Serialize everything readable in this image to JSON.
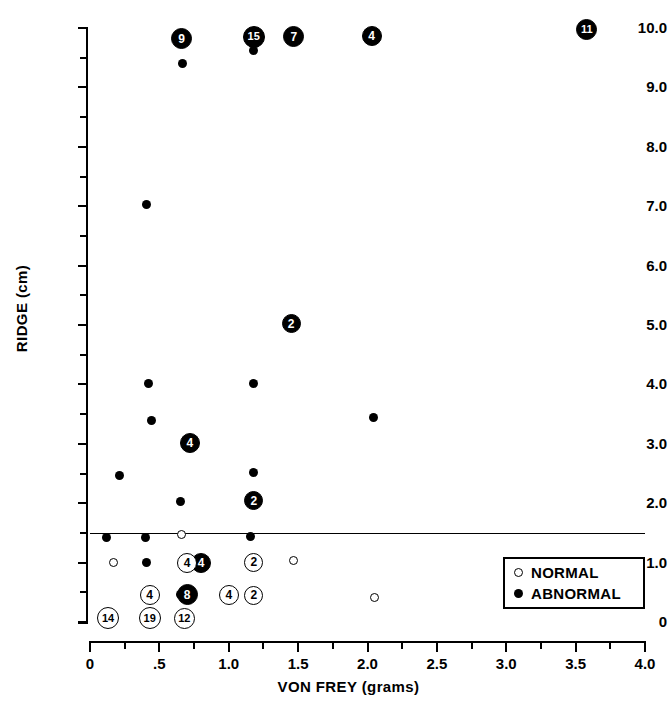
{
  "chart_data": {
    "type": "scatter",
    "title": "",
    "xlabel": "VON FREY (grams)",
    "ylabel": "RIDGE (cm)",
    "xlim": [
      0,
      4.0
    ],
    "ylim": [
      0,
      10.0
    ],
    "grid": false,
    "x_ticks": [
      {
        "value": 0,
        "label": "0"
      },
      {
        "value": 0.5,
        "label": ".5"
      },
      {
        "value": 1.0,
        "label": "1.0"
      },
      {
        "value": 1.5,
        "label": "1.5"
      },
      {
        "value": 2.0,
        "label": "2.0"
      },
      {
        "value": 2.5,
        "label": "2.5"
      },
      {
        "value": 3.0,
        "label": "3.0"
      },
      {
        "value": 3.5,
        "label": "3.5"
      },
      {
        "value": 4.0,
        "label": "4.0"
      }
    ],
    "x_minor_ticks": [
      0.25,
      0.75,
      1.25,
      1.75,
      2.25,
      2.75,
      3.25,
      3.75
    ],
    "y_ticks": [
      {
        "value": 0,
        "label": "0"
      },
      {
        "value": 1.0,
        "label": "1.0"
      },
      {
        "value": 2.0,
        "label": "2.0"
      },
      {
        "value": 3.0,
        "label": "3.0"
      },
      {
        "value": 4.0,
        "label": "4.0"
      },
      {
        "value": 5.0,
        "label": "5.0"
      },
      {
        "value": 6.0,
        "label": "6.0"
      },
      {
        "value": 7.0,
        "label": "7.0"
      },
      {
        "value": 8.0,
        "label": "8.0"
      },
      {
        "value": 9.0,
        "label": "9.0"
      },
      {
        "value": 10.0,
        "label": "10.0"
      }
    ],
    "y_minor_ticks": [
      0.5,
      1.5,
      2.5,
      3.5,
      4.5,
      5.5,
      6.5,
      7.5,
      8.5,
      9.5
    ],
    "legend": {
      "position": "bottom-right",
      "entries": [
        {
          "marker": "open-circle",
          "label": "NORMAL"
        },
        {
          "marker": "filled-circle",
          "label": "ABNORMAL"
        }
      ]
    },
    "annotations": [
      {
        "type": "horizontal-line",
        "y": 1.5,
        "x_start": 0.0,
        "x_end": 4.0
      }
    ],
    "note": "Marker size/number indicates count of overlapping subjects; plain dots are single observations.",
    "series": [
      {
        "name": "ABNORMAL",
        "marker": "filled-circle",
        "color": "#000000",
        "points": [
          {
            "x": 0.66,
            "y": 9.82,
            "count": 9,
            "label": "9"
          },
          {
            "x": 1.18,
            "y": 9.85,
            "count": 15,
            "label": "15"
          },
          {
            "x": 1.47,
            "y": 9.85,
            "count": 7,
            "label": "7"
          },
          {
            "x": 2.03,
            "y": 9.87,
            "count": 4,
            "label": "4"
          },
          {
            "x": 3.58,
            "y": 9.97,
            "count": 11,
            "label": "11"
          },
          {
            "x": 1.18,
            "y": 9.62,
            "count": 1,
            "label": ""
          },
          {
            "x": 0.67,
            "y": 9.4,
            "count": 1,
            "label": ""
          },
          {
            "x": 0.41,
            "y": 7.03,
            "count": 1,
            "label": ""
          },
          {
            "x": 1.45,
            "y": 5.02,
            "count": 2,
            "label": "2"
          },
          {
            "x": 0.42,
            "y": 4.02,
            "count": 1,
            "label": ""
          },
          {
            "x": 1.18,
            "y": 4.02,
            "count": 1,
            "label": ""
          },
          {
            "x": 2.04,
            "y": 3.45,
            "count": 1,
            "label": ""
          },
          {
            "x": 0.44,
            "y": 3.4,
            "count": 1,
            "label": ""
          },
          {
            "x": 0.72,
            "y": 3.02,
            "count": 4,
            "label": "4"
          },
          {
            "x": 0.21,
            "y": 2.46,
            "count": 1,
            "label": ""
          },
          {
            "x": 1.18,
            "y": 2.52,
            "count": 1,
            "label": ""
          },
          {
            "x": 0.65,
            "y": 2.03,
            "count": 1,
            "label": ""
          },
          {
            "x": 1.18,
            "y": 2.04,
            "count": 2,
            "label": "2"
          },
          {
            "x": 0.12,
            "y": 1.43,
            "count": 1,
            "label": ""
          },
          {
            "x": 0.4,
            "y": 1.43,
            "count": 1,
            "label": ""
          },
          {
            "x": 1.16,
            "y": 1.44,
            "count": 1,
            "label": ""
          },
          {
            "x": 0.41,
            "y": 1.01,
            "count": 1,
            "label": ""
          },
          {
            "x": 0.8,
            "y": 1.0,
            "count": 4,
            "label": "4"
          },
          {
            "x": 0.65,
            "y": 0.46,
            "count": 1,
            "label": ""
          },
          {
            "x": 0.7,
            "y": 0.46,
            "count": 8,
            "label": "8"
          },
          {
            "x": 0.44,
            "y": 0.43,
            "count": 1,
            "label": ""
          }
        ]
      },
      {
        "name": "NORMAL",
        "marker": "open-circle",
        "color": "#000000",
        "points": [
          {
            "x": 0.66,
            "y": 1.47,
            "count": 1,
            "label": ""
          },
          {
            "x": 0.17,
            "y": 1.0,
            "count": 1,
            "label": ""
          },
          {
            "x": 0.7,
            "y": 1.0,
            "count": 4,
            "label": "4"
          },
          {
            "x": 1.18,
            "y": 1.01,
            "count": 2,
            "label": "2"
          },
          {
            "x": 1.47,
            "y": 1.04,
            "count": 1,
            "label": ""
          },
          {
            "x": 0.43,
            "y": 0.46,
            "count": 4,
            "label": "4"
          },
          {
            "x": 1.18,
            "y": 0.45,
            "count": 2,
            "label": "2"
          },
          {
            "x": 1.0,
            "y": 0.45,
            "count": 4,
            "label": "4"
          },
          {
            "x": 2.05,
            "y": 0.42,
            "count": 1,
            "label": ""
          },
          {
            "x": 0.13,
            "y": 0.06,
            "count": 14,
            "label": "14"
          },
          {
            "x": 0.43,
            "y": 0.06,
            "count": 19,
            "label": "19"
          },
          {
            "x": 0.68,
            "y": 0.06,
            "count": 12,
            "label": "12"
          }
        ]
      }
    ]
  }
}
